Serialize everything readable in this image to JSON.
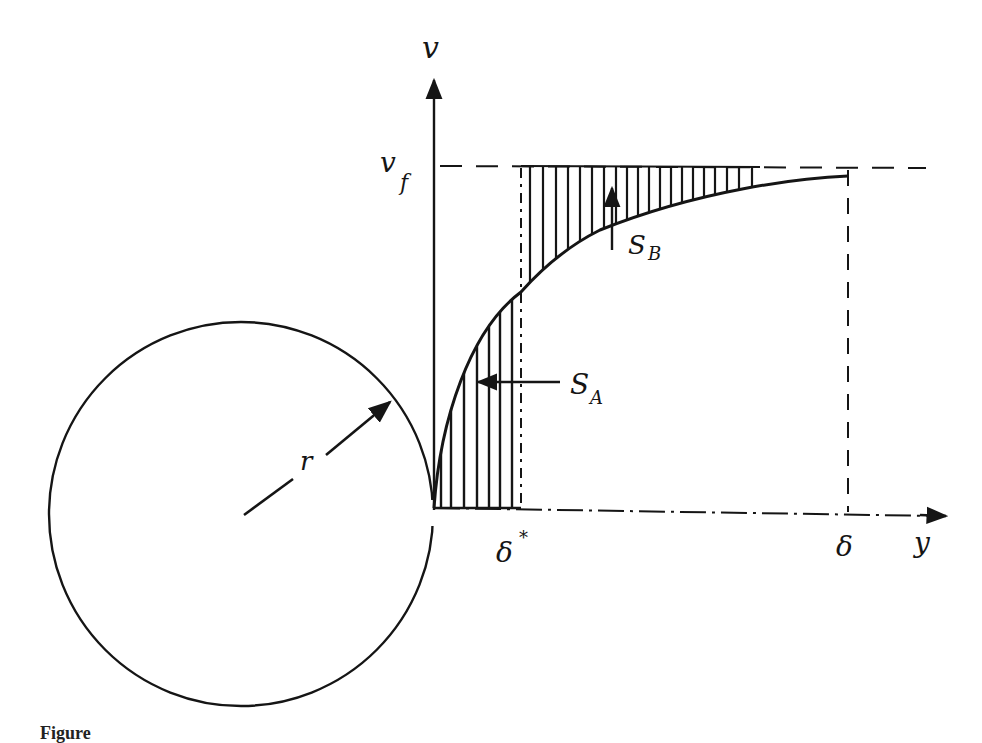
{
  "figure": {
    "caption_visible": "Figure",
    "labels": {
      "y_axis_vertical": "v",
      "v_free_stream": "v",
      "v_free_stream_sub": "f",
      "x_axis": "y",
      "delta_star": "δ",
      "delta_star_sup": "*",
      "delta": "δ",
      "radius": "r",
      "area_A": "S",
      "area_A_sub": "A",
      "area_B": "S",
      "area_B_sub": "B"
    },
    "colors": {
      "ink": "#151515",
      "background": "#ffffff"
    }
  }
}
